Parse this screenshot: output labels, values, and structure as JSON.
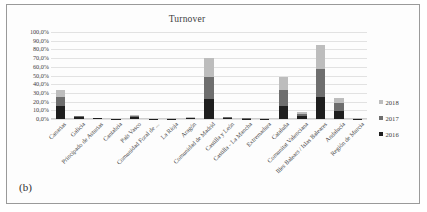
{
  "figure": {
    "subfigure_label": "(b)"
  },
  "chart_data": {
    "type": "bar",
    "subtype": "stacked-column",
    "title": "Turnover",
    "xlabel": "",
    "ylabel": "",
    "ylim": [
      0,
      100
    ],
    "y_tick_labels": [
      "100,0%",
      "90,0%",
      "80,0%",
      "70,0%",
      "60,0%",
      "50,0%",
      "40,0%",
      "30,0%",
      "20,0%",
      "10,0%",
      "0,0%"
    ],
    "y_tick_values": [
      100,
      90,
      80,
      70,
      60,
      50,
      40,
      30,
      20,
      10,
      0
    ],
    "grid": true,
    "legend_position": "right",
    "categories": [
      "Canarias",
      "Galicia",
      "Principado de Asturias",
      "Cantabria",
      "País Vasco",
      "Comunidad Foral de ...",
      "La Rioja",
      "Aragón",
      "Comunidad de Madrid",
      "Castilla y León",
      "Castilla - La Mancha",
      "Extremadura",
      "Cataluña",
      "Comunitat Valenciana",
      "Illes Balears / Islas Baleares",
      "Andalucía",
      "Región de Murcia"
    ],
    "series": [
      {
        "name": "2016",
        "color": "#1f1f1f",
        "values": [
          15.0,
          2.0,
          0.6,
          0.2,
          2.2,
          0.2,
          0.3,
          1.0,
          23.0,
          1.0,
          0.4,
          0.3,
          15.0,
          3.5,
          25.0,
          9.0,
          0.3
        ]
      },
      {
        "name": "2017",
        "color": "#6e6e6e",
        "values": [
          10.0,
          1.2,
          0.4,
          0.2,
          1.4,
          0.2,
          0.2,
          0.7,
          25.0,
          0.8,
          0.3,
          0.2,
          18.0,
          2.5,
          32.0,
          9.0,
          0.2
        ]
      },
      {
        "name": "2018",
        "color": "#bdbdbd",
        "values": [
          8.0,
          0.8,
          0.3,
          0.1,
          1.0,
          0.1,
          0.2,
          0.5,
          22.0,
          0.6,
          0.2,
          0.2,
          15.0,
          2.0,
          28.0,
          6.0,
          0.2
        ]
      }
    ],
    "legend_entries": [
      {
        "label": "2018",
        "color": "#bdbdbd"
      },
      {
        "label": "2017",
        "color": "#6e6e6e"
      },
      {
        "label": "2016",
        "color": "#1f1f1f"
      }
    ]
  }
}
